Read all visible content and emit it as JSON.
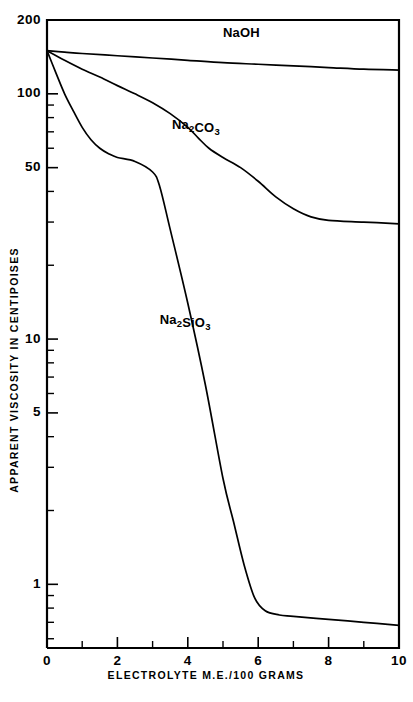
{
  "chart_data": {
    "type": "line",
    "title": "",
    "xlabel": "ELECTROLYTE   M.E./100 GRAMS",
    "ylabel": "APPARENT  VISCOSITY  IN  CENTIPOISES",
    "yscale": "log",
    "xscale": "linear",
    "xlim": [
      0,
      10
    ],
    "ylim": [
      0.55,
      200
    ],
    "grid": false,
    "legend_position": "inline-annotations",
    "xticks": [
      0,
      2,
      4,
      6,
      8,
      10
    ],
    "xtick_labels": [
      "0",
      "2",
      "4",
      "6",
      "8",
      "10"
    ],
    "xminor_ticks": [
      1,
      3,
      5,
      7,
      9
    ],
    "yticks": [
      200,
      100,
      50,
      10,
      5,
      1
    ],
    "ytick_labels": [
      "200",
      "100",
      "50",
      "10",
      "5",
      "1"
    ],
    "yminor_ticks": [
      90,
      80,
      70,
      60,
      40,
      30,
      20,
      9,
      8,
      7,
      6,
      4,
      3,
      2,
      0.9,
      0.8,
      0.7,
      0.6
    ],
    "series": [
      {
        "name": "NaOH",
        "label_parts": [
          {
            "t": "NaOH",
            "sub": false
          }
        ],
        "label_x": 5.0,
        "label_y": 170,
        "x": [
          0,
          0.5,
          1,
          2,
          3,
          4,
          5,
          6,
          7,
          8,
          9,
          10
        ],
        "values": [
          150,
          148,
          146,
          143,
          140,
          137,
          134,
          132,
          130,
          128,
          126,
          125
        ]
      },
      {
        "name": "Na2CO3",
        "label_parts": [
          {
            "t": "Na",
            "sub": false
          },
          {
            "t": "2",
            "sub": true
          },
          {
            "t": "CO",
            "sub": false
          },
          {
            "t": "3",
            "sub": true
          }
        ],
        "label_x": 3.55,
        "label_y": 72,
        "x": [
          0,
          0.5,
          1,
          1.5,
          2,
          2.5,
          3,
          3.5,
          4,
          4.3,
          4.6,
          5,
          5.5,
          6,
          6.5,
          7,
          7.5,
          8,
          9,
          10
        ],
        "values": [
          150,
          137,
          126,
          117,
          108,
          100,
          92,
          83,
          73,
          66,
          60,
          55,
          50,
          44,
          38,
          34,
          31.5,
          30.5,
          30,
          29.5
        ]
      },
      {
        "name": "Na2SiO3",
        "label_parts": [
          {
            "t": "Na",
            "sub": false
          },
          {
            "t": "2",
            "sub": true
          },
          {
            "t": "SiO",
            "sub": false
          },
          {
            "t": "3",
            "sub": true
          }
        ],
        "label_x": 3.2,
        "label_y": 11.5,
        "x": [
          0,
          0.25,
          0.5,
          0.75,
          1,
          1.25,
          1.5,
          1.75,
          2,
          2.5,
          3,
          3.2,
          3.5,
          4,
          4.5,
          5,
          5.3,
          5.6,
          5.9,
          6.2,
          6.6,
          7,
          8,
          9,
          10
        ],
        "values": [
          150,
          122,
          100,
          85,
          73,
          65,
          60,
          57,
          55,
          53,
          48,
          42,
          28,
          14,
          6.5,
          2.7,
          1.8,
          1.2,
          0.88,
          0.78,
          0.75,
          0.74,
          0.72,
          0.7,
          0.68
        ]
      }
    ]
  }
}
